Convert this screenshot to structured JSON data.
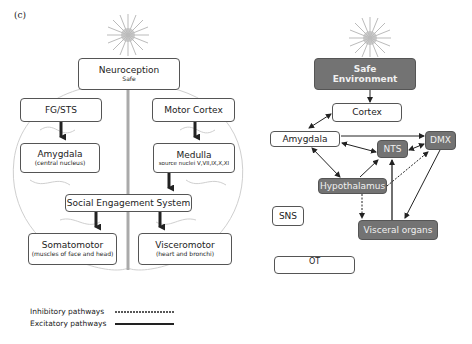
{
  "panel_label": "(c)",
  "left": {
    "neuroception": {
      "title": "Neuroception",
      "sub": "Safe"
    },
    "fg_sts": "FG/STS",
    "motor_cortex": "Motor Cortex",
    "amygdala": {
      "title": "Amygdala",
      "sub": "(central nucleus)"
    },
    "medulla": {
      "title": "Medulla",
      "sub": "source nuclei V,VII,IX,X,XI"
    },
    "ses": "Social Engagement System",
    "somatomotor": {
      "title": "Somatomotor",
      "sub": "(muscles of face and head)"
    },
    "visceromotor": {
      "title": "Visceromotor",
      "sub": "(heart and bronchi)"
    }
  },
  "right": {
    "safe_env": {
      "line1": "Safe",
      "line2": "Environment"
    },
    "cortex": "Cortex",
    "amygdala": "Amygdala",
    "nts": "NTS",
    "dmx": "DMX",
    "hypothalamus": "Hypothalamus",
    "visceral": "Visceral organs",
    "sns": "SNS",
    "ot": "OT"
  },
  "legend": {
    "inhibitory": "Inhibitory pathways",
    "excitatory": "Excitatory pathways"
  }
}
